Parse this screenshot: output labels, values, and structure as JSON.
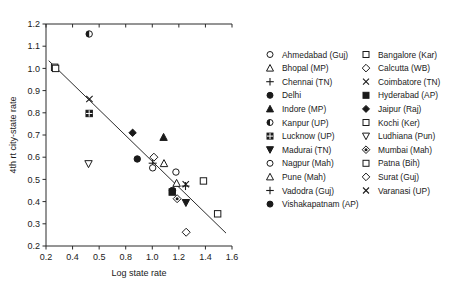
{
  "chart_data": {
    "type": "scatter",
    "title": "",
    "xlabel": "Log state rate",
    "ylabel": "4th rt city-state rate",
    "xlim": [
      0.2,
      1.6
    ],
    "ylim": [
      0.2,
      1.2
    ],
    "xticks": [
      "0.2",
      "0.4",
      "0.5",
      "0.8",
      "1.0",
      "1.2",
      "1.4",
      "1.6"
    ],
    "xtick_values": [
      0.2,
      0.4,
      0.6,
      0.8,
      1.0,
      1.2,
      1.4,
      1.6
    ],
    "yticks": [
      "0.2",
      "0.3",
      "0.4",
      "0.5",
      "0.6",
      "0.7",
      "0.8",
      "0.9",
      "1.0",
      "1.1",
      "1.2"
    ],
    "ytick_values": [
      0.2,
      0.3,
      0.4,
      0.5,
      0.6,
      0.7,
      0.8,
      0.9,
      1.0,
      1.1,
      1.2
    ],
    "grid": false,
    "legend_position": "right",
    "trendline": {
      "x0": 0.22,
      "y0": 1.035,
      "x1": 1.555,
      "y1": 0.258
    },
    "points": [
      {
        "label": "Kochi (Ker)",
        "marker": "square-open",
        "x": 0.265,
        "y": 1.005
      },
      {
        "label": "Bangalore (Kar)",
        "marker": "square-open",
        "x": 0.272,
        "y": 1.0
      },
      {
        "label": "Kanpur (UP)",
        "marker": "circle-halfleft",
        "x": 0.525,
        "y": 1.155
      },
      {
        "label": "Coimbatore (TN)",
        "marker": "x-cross",
        "x": 0.527,
        "y": 0.862
      },
      {
        "label": "Lucknow (UP)",
        "marker": "square-hatched",
        "x": 0.525,
        "y": 0.797
      },
      {
        "label": "Ludhiana (Pun)",
        "marker": "triangle-down-open",
        "x": 0.52,
        "y": 0.57
      },
      {
        "label": "Jaipur (Raj)",
        "marker": "diamond-fill",
        "x": 0.852,
        "y": 0.71
      },
      {
        "label": "Vishakapatnam (AP)",
        "marker": "circle-fill",
        "x": 0.887,
        "y": 0.592
      },
      {
        "label": "Indore (MP)",
        "marker": "triangle-up-fill",
        "x": 1.085,
        "y": 0.69
      },
      {
        "label": "Calcutta (WB)",
        "marker": "diamond-open",
        "x": 1.012,
        "y": 0.6
      },
      {
        "label": "Pune (Mah)",
        "marker": "triangle-up-open",
        "x": 1.088,
        "y": 0.572
      },
      {
        "label": "Vadodra (Guj)",
        "marker": "plus",
        "x": 1.003,
        "y": 0.573
      },
      {
        "label": "Ahmedabad (Guj)",
        "marker": "circle-open",
        "x": 1.003,
        "y": 0.552
      },
      {
        "label": "Nagpur (Mah)",
        "marker": "circle-open",
        "x": 1.178,
        "y": 0.533
      },
      {
        "label": "Patna (Bih)",
        "marker": "square-open",
        "x": 1.385,
        "y": 0.493
      },
      {
        "label": "Bhopal (MP)",
        "marker": "triangle-up-open",
        "x": 1.183,
        "y": 0.483
      },
      {
        "label": "Varanasi (UP)",
        "marker": "x-cross",
        "x": 1.252,
        "y": 0.478
      },
      {
        "label": "Chennai (TN)",
        "marker": "plus",
        "x": 1.25,
        "y": 0.47
      },
      {
        "label": "Delhi",
        "marker": "circle-fill",
        "x": 1.152,
        "y": 0.45
      },
      {
        "label": "Hyderabad (AP)",
        "marker": "square-fill",
        "x": 1.15,
        "y": 0.443
      },
      {
        "label": "Mumbai (Mah)",
        "marker": "diamond-target",
        "x": 1.187,
        "y": 0.413
      },
      {
        "label": "Madurai (TN)",
        "marker": "triangle-down-fill",
        "x": 1.253,
        "y": 0.395
      },
      {
        "label": "Kochi (Ker) 2",
        "marker": "square-open",
        "x": 1.492,
        "y": 0.345
      },
      {
        "label": "Surat (Guj)",
        "marker": "diamond-open",
        "x": 1.255,
        "y": 0.262
      }
    ],
    "legend": {
      "column_left": [
        {
          "label": "Ahmedabad (Guj)",
          "marker": "circle-open"
        },
        {
          "label": "Bhopal (MP)",
          "marker": "triangle-up-open"
        },
        {
          "label": "Chennai (TN)",
          "marker": "plus"
        },
        {
          "label": "Delhi",
          "marker": "circle-fill"
        },
        {
          "label": "Indore (MP)",
          "marker": "triangle-up-fill"
        },
        {
          "label": "Kanpur (UP)",
          "marker": "circle-halfleft"
        },
        {
          "label": "Lucknow (UP)",
          "marker": "square-hatched"
        },
        {
          "label": "Madurai (TN)",
          "marker": "triangle-down-fill"
        },
        {
          "label": "Nagpur (Mah)",
          "marker": "circle-open"
        },
        {
          "label": "Pune (Mah)",
          "marker": "triangle-up-open"
        },
        {
          "label": "Vadodra (Guj)",
          "marker": "plus"
        },
        {
          "label": "Vishakapatnam (AP)",
          "marker": "circle-fill"
        }
      ],
      "column_right": [
        {
          "label": "Bangalore (Kar)",
          "marker": "square-open"
        },
        {
          "label": "Calcutta (WB)",
          "marker": "diamond-open"
        },
        {
          "label": "Coimbatore (TN)",
          "marker": "x-cross"
        },
        {
          "label": "Hyderabad (AP)",
          "marker": "square-fill"
        },
        {
          "label": "Jaipur (Raj)",
          "marker": "diamond-fill"
        },
        {
          "label": "Kochi (Ker)",
          "marker": "square-open"
        },
        {
          "label": "Ludhiana (Pun)",
          "marker": "triangle-down-open"
        },
        {
          "label": "Mumbai (Mah)",
          "marker": "diamond-target"
        },
        {
          "label": "Patna (Bih)",
          "marker": "square-open"
        },
        {
          "label": "Surat (Guj)",
          "marker": "diamond-open"
        },
        {
          "label": "Varanasi (UP)",
          "marker": "x-cross"
        }
      ]
    },
    "colors": {
      "foreground": "#1a1a1a",
      "axis": "#2b2b2b",
      "background": "#ffffff"
    }
  }
}
